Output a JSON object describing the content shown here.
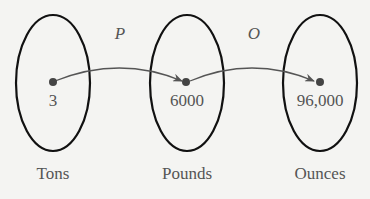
{
  "diagram": {
    "sets": [
      {
        "label": "Tons",
        "value": "3"
      },
      {
        "label": "Pounds",
        "value": "6000"
      },
      {
        "label": "Ounces",
        "value": "96,000"
      }
    ],
    "functions": [
      {
        "name": "P",
        "from": "Tons",
        "to": "Pounds"
      },
      {
        "name": "O",
        "from": "Pounds",
        "to": "Ounces"
      }
    ],
    "colors": {
      "ellipse": "#111111",
      "arrow": "#555555",
      "point": "#444444",
      "text": "#555555"
    }
  }
}
